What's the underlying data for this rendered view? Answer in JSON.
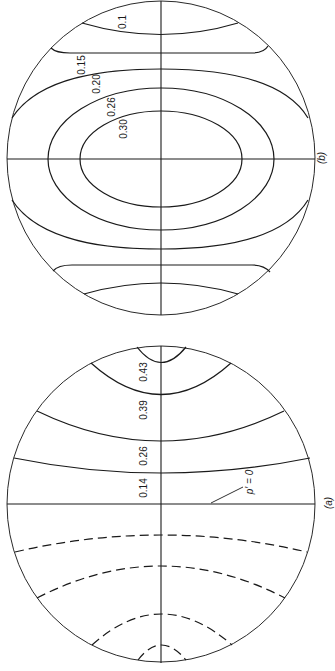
{
  "figure": {
    "orientation": "rotated-90-counterclockwise",
    "colors": {
      "ink": "#1a1a1a",
      "background": "#ffffff"
    },
    "panels": [
      {
        "id": "b",
        "label": "(b)",
        "contour_labels": [
          "0.1",
          "0.15",
          "0.20",
          "0.26",
          "0.30"
        ],
        "line_style": "solid"
      },
      {
        "id": "a",
        "label": "(a)",
        "contour_labels": [
          "0.43",
          "0.39",
          "0.26",
          "0.14"
        ],
        "zero_line_label": "p′ = 0",
        "dashed_contours": 4,
        "line_style": "solid-positive / dashed-negative"
      }
    ]
  },
  "panel_b": {
    "label": "(b)",
    "labels": {
      "c1": "0.1",
      "c2": "0.15",
      "c3": "0.20",
      "c4": "0.26",
      "c5": "0.30"
    }
  },
  "panel_a": {
    "label": "(a)",
    "labels": {
      "c1": "0.43",
      "c2": "0.39",
      "c3": "0.26",
      "c4": "0.14",
      "zero": "p′ = 0"
    }
  }
}
